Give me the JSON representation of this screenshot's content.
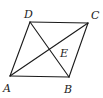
{
  "figure": {
    "type": "parallelogram-with-diagonals",
    "stroke_color": "#1a1a1a",
    "label_color": "#222222",
    "vertices": {
      "A": {
        "x": 10,
        "y": 76,
        "label": "A",
        "label_x": 3,
        "label_y": 92
      },
      "B": {
        "x": 69,
        "y": 77,
        "label": "B",
        "label_x": 64,
        "label_y": 93
      },
      "C": {
        "x": 88,
        "y": 23,
        "label": "C",
        "label_x": 91,
        "label_y": 19
      },
      "D": {
        "x": 30,
        "y": 22,
        "label": "D",
        "label_x": 24,
        "label_y": 18
      },
      "E": {
        "x": 49,
        "y": 50,
        "label": "E",
        "label_x": 60,
        "label_y": 57
      }
    },
    "segments": [
      {
        "from": "A",
        "to": "B"
      },
      {
        "from": "B",
        "to": "C"
      },
      {
        "from": "C",
        "to": "D"
      },
      {
        "from": "D",
        "to": "A"
      },
      {
        "from": "A",
        "to": "C"
      },
      {
        "from": "D",
        "to": "B"
      }
    ]
  }
}
